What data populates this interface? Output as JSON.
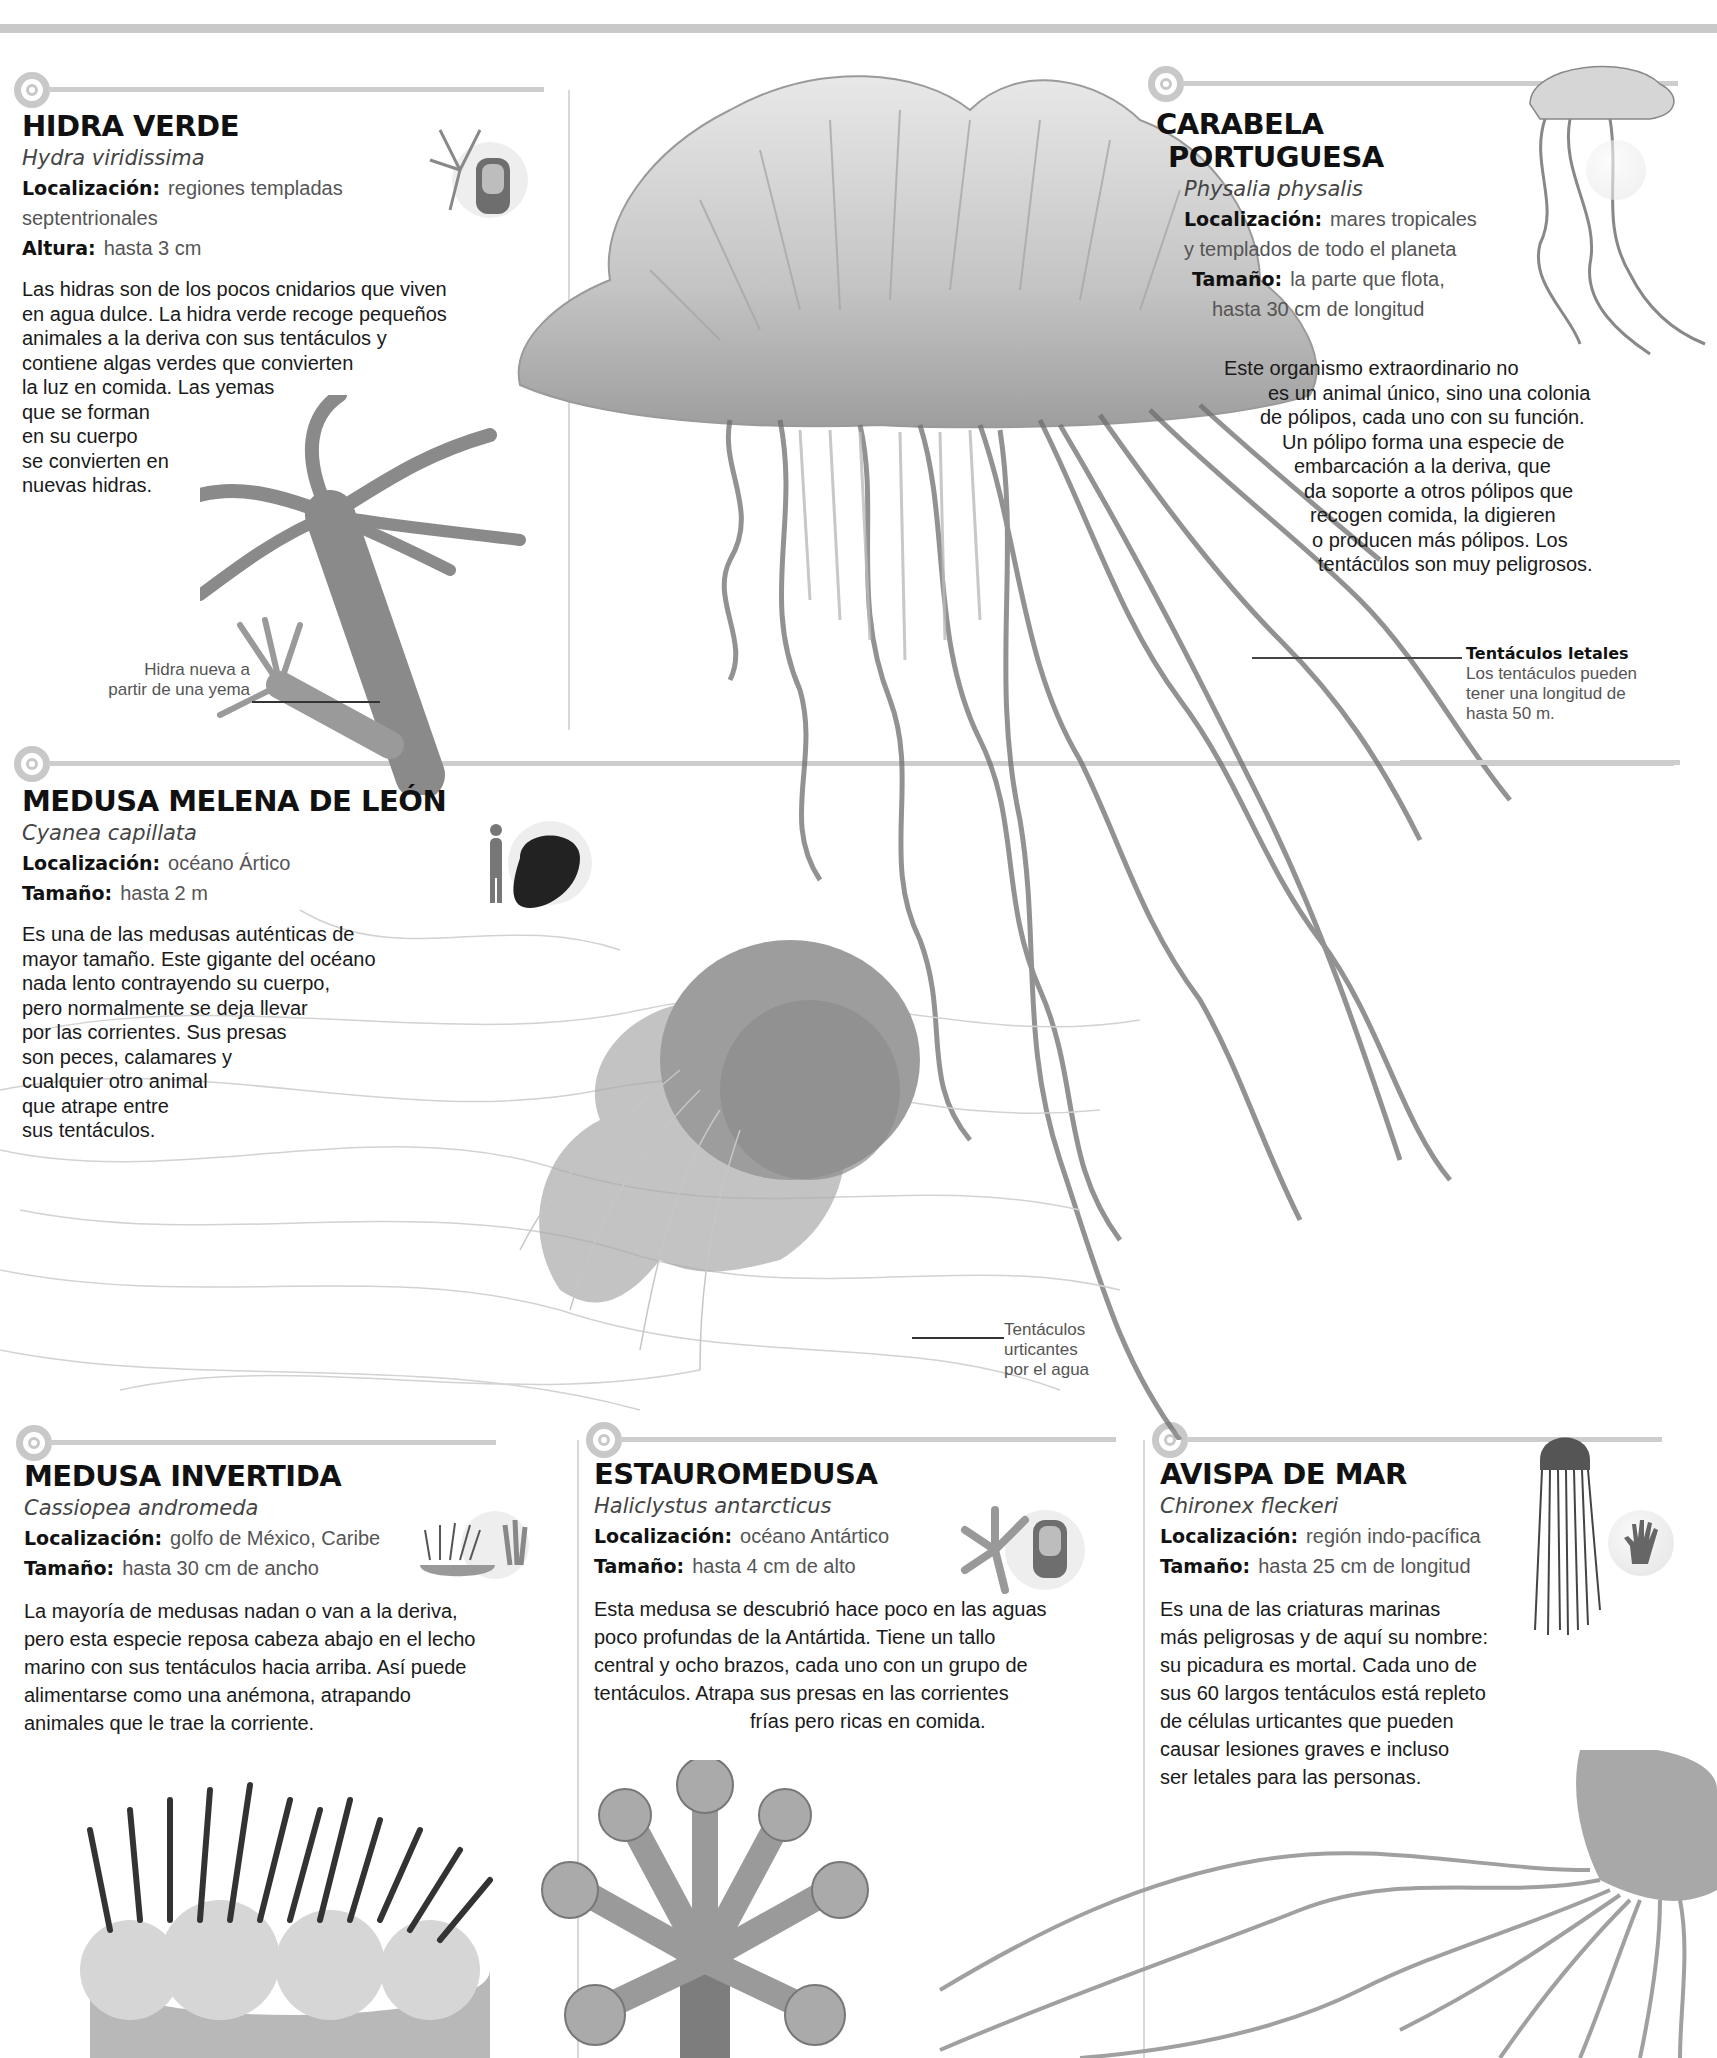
{
  "page": {
    "theme_colors": {
      "background": "#ffffff",
      "divider": "#c9c9c9",
      "text": "#1a1a1a",
      "muted": "#555555"
    }
  },
  "sections": {
    "hidra": {
      "title": "HIDRA VERDE",
      "scientific": "Hydra viridissima",
      "facts": [
        {
          "key": "Localización:",
          "value": "regiones templadas",
          "value2": "septentrionales"
        },
        {
          "key": "Altura:",
          "value": "hasta 3 cm"
        }
      ],
      "body_lines": [
        "Las hidras son de los pocos cnidarios que viven",
        "en agua dulce. La hidra verde recoge pequeños",
        "animales a la deriva con sus tentáculos y",
        "contiene algas verdes que convierten",
        "la luz en comida. Las yemas",
        "que se forman",
        "en su cuerpo",
        "se convierten en",
        "nuevas hidras."
      ],
      "icon": "finger-scale-icon",
      "callout": {
        "lines": [
          "Hidra nueva a",
          "partir de una yema"
        ]
      }
    },
    "carabela": {
      "title_lines": [
        "CARABELA",
        "PORTUGUESA"
      ],
      "scientific": "Physalia physalis",
      "facts": [
        {
          "key": "Localización:",
          "value": "mares tropicales",
          "value2": "y templados de todo el planeta"
        },
        {
          "key": "Tamaño:",
          "value": "la parte que flota,",
          "value2": "hasta 30 cm de longitud"
        }
      ],
      "body_lines": [
        "Este organismo extraordinario no",
        "es un animal único, sino una colonia",
        "de pólipos, cada uno con su función.",
        "Un pólipo forma una especie de",
        "embarcación a la deriva, que",
        "da soporte a otros pólipos que",
        "recogen comida, la digieren",
        "o producen más pólipos. Los",
        "tentáculos son muy peligrosos."
      ],
      "icon": "hand-scale-icon",
      "callout": {
        "title": "Tentáculos letales",
        "lines": [
          "Los tentáculos pueden",
          "tener una longitud de",
          "hasta 50 m."
        ]
      }
    },
    "melena": {
      "title": "MEDUSA MELENA DE LEÓN",
      "scientific": "Cyanea capillata",
      "facts": [
        {
          "key": "Localización:",
          "value": "océano Ártico"
        },
        {
          "key": "Tamaño:",
          "value": "hasta 2 m"
        }
      ],
      "body_lines": [
        "Es una de las medusas auténticas de",
        "mayor tamaño. Este gigante del océano",
        "nada lento contrayendo su cuerpo,",
        "pero normalmente se deja llevar",
        "por las corrientes. Sus presas",
        "son peces, calamares y",
        "cualquier otro animal",
        "que atrape entre",
        "sus tentáculos."
      ],
      "icon": "human-scale-icon",
      "callout": {
        "lines": [
          "Tentáculos",
          "urticantes",
          "por el agua"
        ]
      }
    },
    "invertida": {
      "title": "MEDUSA INVERTIDA",
      "scientific": "Cassiopea andromeda",
      "facts": [
        {
          "key": "Localización:",
          "value": "golfo de México, Caribe"
        },
        {
          "key": "Tamaño:",
          "value": "hasta 30 cm de ancho"
        }
      ],
      "body_lines": [
        "La mayoría de medusas nadan o van a la deriva,",
        "pero esta especie reposa cabeza abajo en el lecho",
        "marino con sus tentáculos hacia arriba. Así puede",
        "alimentarse como una anémona, atrapando",
        "animales que le trae la corriente."
      ],
      "icon": "hand-scale-icon"
    },
    "estauro": {
      "title": "ESTAUROMEDUSA",
      "scientific": "Haliclystus antarcticus",
      "facts": [
        {
          "key": "Localización:",
          "value": "océano Antártico"
        },
        {
          "key": "Tamaño:",
          "value": "hasta 4 cm de alto"
        }
      ],
      "body_lines": [
        "Esta medusa se descubrió hace poco en las aguas",
        "poco profundas de la Antártida. Tiene un tallo",
        "central y ocho brazos, cada uno con un grupo de",
        "tentáculos. Atrapa sus presas en las corrientes",
        "frías pero ricas en comida."
      ],
      "icon": "finger-scale-icon"
    },
    "avispa": {
      "title": "AVISPA DE MAR",
      "scientific": "Chironex fleckeri",
      "facts": [
        {
          "key": "Localización:",
          "value": "región indo-pacífica"
        },
        {
          "key": "Tamaño:",
          "value": "hasta 25 cm de longitud"
        }
      ],
      "body_lines": [
        "Es una de las criaturas marinas",
        "más peligrosas y de aquí su nombre:",
        "su picadura es mortal. Cada uno de",
        "sus 60 largos tentáculos está repleto",
        "de células urticantes que pueden",
        "causar lesiones graves e incluso",
        "ser letales para las personas."
      ],
      "icon": "hand-scale-icon"
    }
  }
}
